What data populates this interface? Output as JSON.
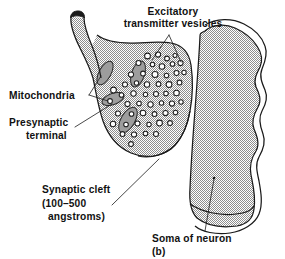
{
  "figure": {
    "caption": "(b)",
    "colors": {
      "stipple_dot": "#8c8c8c",
      "stipple_background": "#ffffff",
      "outline": "#1a1a1a",
      "mitochondria_fill": "#9d9d9d",
      "vesicle_fill": "#ffffff",
      "text": "#111111"
    }
  },
  "labels": {
    "excitatory_vesicles": {
      "line1": "Excitatory",
      "line2": "transmitter vesicles"
    },
    "mitochondria": {
      "line1": "Mitochondria"
    },
    "presynaptic_terminal": {
      "line1": "Presynaptic",
      "line2": "terminal"
    },
    "synaptic_cleft": {
      "line1": "Synaptic cleft",
      "line2": "(100–500",
      "line3": "angstroms)"
    },
    "soma": {
      "line1": "Soma of neuron"
    }
  },
  "structures": {
    "presynaptic_terminal": {
      "name": "presynaptic terminal",
      "fill": "stipple"
    },
    "soma": {
      "name": "soma of neuron",
      "fill": "stipple"
    },
    "mitochondria_count": 4,
    "vesicle_count": 52
  },
  "vesicles": [
    {
      "cx": 147.5,
      "cy": 56.0,
      "r": 2.9
    },
    {
      "cx": 158.0,
      "cy": 54.5,
      "r": 2.6
    },
    {
      "cx": 167.0,
      "cy": 58.5,
      "r": 2.4
    },
    {
      "cx": 175.0,
      "cy": 55.5,
      "r": 2.0
    },
    {
      "cx": 138.5,
      "cy": 63.0,
      "r": 2.5
    },
    {
      "cx": 152.5,
      "cy": 64.5,
      "r": 2.2
    },
    {
      "cx": 162.0,
      "cy": 66.5,
      "r": 2.8
    },
    {
      "cx": 172.5,
      "cy": 64.0,
      "r": 2.3
    },
    {
      "cx": 180.5,
      "cy": 63.0,
      "r": 2.6
    },
    {
      "cx": 113.5,
      "cy": 90.0,
      "r": 2.9
    },
    {
      "cx": 131.0,
      "cy": 74.5,
      "r": 2.6
    },
    {
      "cx": 143.0,
      "cy": 73.5,
      "r": 2.4
    },
    {
      "cx": 155.0,
      "cy": 74.5,
      "r": 3.0
    },
    {
      "cx": 166.5,
      "cy": 75.5,
      "r": 2.3
    },
    {
      "cx": 176.5,
      "cy": 73.0,
      "r": 2.5
    },
    {
      "cx": 184.0,
      "cy": 72.5,
      "r": 2.2
    },
    {
      "cx": 125.0,
      "cy": 84.5,
      "r": 2.5
    },
    {
      "cx": 136.5,
      "cy": 83.0,
      "r": 2.2
    },
    {
      "cx": 147.0,
      "cy": 84.5,
      "r": 2.7
    },
    {
      "cx": 158.5,
      "cy": 84.0,
      "r": 2.4
    },
    {
      "cx": 169.0,
      "cy": 84.5,
      "r": 2.9
    },
    {
      "cx": 179.5,
      "cy": 82.5,
      "r": 2.4
    },
    {
      "cx": 121.5,
      "cy": 95.0,
      "r": 2.3
    },
    {
      "cx": 133.5,
      "cy": 93.5,
      "r": 2.7
    },
    {
      "cx": 145.5,
      "cy": 94.5,
      "r": 2.2
    },
    {
      "cx": 156.0,
      "cy": 94.0,
      "r": 2.5
    },
    {
      "cx": 166.0,
      "cy": 93.5,
      "r": 2.3
    },
    {
      "cx": 176.5,
      "cy": 93.0,
      "r": 2.8
    },
    {
      "cx": 110.0,
      "cy": 101.0,
      "r": 2.4
    },
    {
      "cx": 127.5,
      "cy": 104.0,
      "r": 2.6
    },
    {
      "cx": 139.0,
      "cy": 103.5,
      "r": 2.3
    },
    {
      "cx": 150.5,
      "cy": 104.5,
      "r": 2.7
    },
    {
      "cx": 161.5,
      "cy": 103.0,
      "r": 2.2
    },
    {
      "cx": 172.0,
      "cy": 103.5,
      "r": 2.6
    },
    {
      "cx": 181.0,
      "cy": 102.0,
      "r": 2.2
    },
    {
      "cx": 118.0,
      "cy": 113.5,
      "r": 2.5
    },
    {
      "cx": 131.5,
      "cy": 114.0,
      "r": 2.3
    },
    {
      "cx": 143.0,
      "cy": 113.0,
      "r": 2.8
    },
    {
      "cx": 154.5,
      "cy": 114.0,
      "r": 2.4
    },
    {
      "cx": 165.5,
      "cy": 113.0,
      "r": 2.6
    },
    {
      "cx": 175.5,
      "cy": 112.5,
      "r": 2.3
    },
    {
      "cx": 113.0,
      "cy": 124.0,
      "r": 2.7
    },
    {
      "cx": 126.0,
      "cy": 124.5,
      "r": 2.3
    },
    {
      "cx": 137.5,
      "cy": 123.5,
      "r": 2.5
    },
    {
      "cx": 149.0,
      "cy": 124.5,
      "r": 2.2
    },
    {
      "cx": 159.5,
      "cy": 123.0,
      "r": 2.9
    },
    {
      "cx": 170.0,
      "cy": 123.0,
      "r": 2.4
    },
    {
      "cx": 122.5,
      "cy": 134.0,
      "r": 2.4
    },
    {
      "cx": 134.0,
      "cy": 134.5,
      "r": 2.6
    },
    {
      "cx": 145.5,
      "cy": 133.5,
      "r": 2.3
    },
    {
      "cx": 156.0,
      "cy": 134.0,
      "r": 2.5
    },
    {
      "cx": 131.0,
      "cy": 144.0,
      "r": 2.4
    }
  ],
  "mitochondria": [
    {
      "cx": 105.0,
      "cy": 73.0,
      "rx": 6.0,
      "rz": 13.0,
      "angle": 28
    },
    {
      "cx": 138.0,
      "cy": 74.0,
      "rx": 6.5,
      "rz": 13.5,
      "angle": 18
    },
    {
      "cx": 113.0,
      "cy": 99.0,
      "rx": 5.5,
      "rz": 11.5,
      "angle": 70
    },
    {
      "cx": 128.0,
      "cy": 120.0,
      "rx": 7.0,
      "rz": 14.0,
      "angle": 30
    }
  ]
}
